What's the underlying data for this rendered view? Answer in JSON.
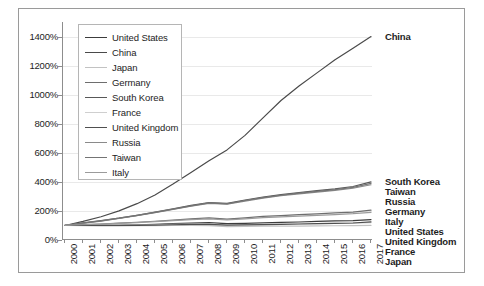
{
  "chart_data": {
    "type": "line",
    "title": "",
    "subtitle": "",
    "xlabel": "",
    "ylabel": "",
    "xlim": [
      2000,
      2017
    ],
    "ylim": [
      0,
      1500
    ],
    "ytick_labels": [
      "1400%",
      "1200%",
      "1000%",
      "800%",
      "600%",
      "400%",
      "200%",
      "0%"
    ],
    "ytick_values": [
      1400,
      1200,
      1000,
      800,
      600,
      400,
      200,
      0
    ],
    "grid": "horizontal",
    "legend_position": "top-left-inside",
    "x": [
      2000,
      2001,
      2002,
      2003,
      2004,
      2005,
      2006,
      2007,
      2008,
      2009,
      2010,
      2011,
      2012,
      2013,
      2014,
      2015,
      2016,
      2017
    ],
    "xtick_labels": [
      "2000",
      "2001",
      "2002",
      "2003",
      "2004",
      "2005",
      "2006",
      "2007",
      "2008",
      "2009",
      "2010",
      "2011",
      "2012",
      "2013",
      "2014",
      "2015",
      "2016",
      "2017"
    ],
    "series": [
      {
        "name": "United States",
        "color": "#3c3c3c",
        "end_label": "United States",
        "values": [
          100,
          102,
          100,
          101,
          104,
          108,
          112,
          116,
          119,
          112,
          114,
          118,
          121,
          124,
          128,
          131,
          134,
          140
        ]
      },
      {
        "name": "China",
        "color": "#4a4a4a",
        "end_label": "China",
        "values": [
          100,
          128,
          160,
          200,
          250,
          310,
          385,
          465,
          545,
          620,
          720,
          840,
          960,
          1060,
          1150,
          1240,
          1320,
          1400
        ]
      },
      {
        "name": "Japan",
        "color": "#c2c2c2",
        "end_label": "Japan",
        "values": [
          100,
          99,
          97,
          97,
          98,
          99,
          100,
          100,
          99,
          92,
          94,
          95,
          95,
          96,
          97,
          98,
          99,
          100
        ]
      },
      {
        "name": "Germany",
        "color": "#6e6e6e",
        "end_label": "Germany",
        "values": [
          100,
          106,
          110,
          116,
          122,
          129,
          137,
          145,
          152,
          144,
          152,
          162,
          168,
          174,
          180,
          186,
          192,
          205
        ]
      },
      {
        "name": "South Korea",
        "color": "#585858",
        "end_label": "South Korea",
        "values": [
          100,
          118,
          133,
          150,
          170,
          192,
          214,
          238,
          258,
          252,
          275,
          296,
          312,
          326,
          340,
          352,
          368,
          400
        ]
      },
      {
        "name": "France",
        "color": "#cfcfcf",
        "end_label": "France",
        "values": [
          100,
          101,
          100,
          101,
          103,
          105,
          107,
          109,
          110,
          104,
          106,
          108,
          109,
          110,
          112,
          114,
          116,
          120
        ]
      },
      {
        "name": "United Kingdom",
        "color": "#4f4f4f",
        "end_label": "United Kingdom",
        "values": [
          100,
          101,
          100,
          100,
          101,
          103,
          105,
          107,
          108,
          102,
          104,
          106,
          108,
          110,
          112,
          114,
          117,
          125
        ]
      },
      {
        "name": "Russia",
        "color": "#8a8a8a",
        "end_label": "Russia",
        "values": [
          100,
          115,
          130,
          148,
          167,
          188,
          210,
          232,
          252,
          246,
          268,
          288,
          305,
          318,
          330,
          342,
          356,
          380
        ]
      },
      {
        "name": "Taiwan",
        "color": "#747474",
        "end_label": "Taiwan",
        "values": [
          100,
          117,
          132,
          150,
          169,
          190,
          212,
          235,
          255,
          249,
          272,
          292,
          308,
          322,
          335,
          347,
          362,
          390
        ]
      },
      {
        "name": "Italy",
        "color": "#9b9b9b",
        "end_label": "Italy",
        "values": [
          100,
          105,
          109,
          114,
          120,
          126,
          133,
          140,
          146,
          138,
          145,
          154,
          159,
          164,
          170,
          175,
          181,
          190
        ]
      }
    ],
    "end_labels": [
      {
        "text": "China",
        "y_value": 1400
      },
      {
        "text": "South Korea",
        "y_value": 400
      },
      {
        "text": "Taiwan",
        "y_value": 390
      },
      {
        "text": "Russia",
        "y_value": 380
      },
      {
        "text": "Germany",
        "y_value": 205
      },
      {
        "text": "Italy",
        "y_value": 190
      },
      {
        "text": "United States",
        "y_value": 140
      },
      {
        "text": "United Kingdom",
        "y_value": 125
      },
      {
        "text": "France",
        "y_value": 120
      },
      {
        "text": "Japan",
        "y_value": 100
      }
    ]
  },
  "legend": {
    "items": [
      {
        "label": "United States"
      },
      {
        "label": "China"
      },
      {
        "label": "Japan"
      },
      {
        "label": "Germany"
      },
      {
        "label": "South Korea"
      },
      {
        "label": "France"
      },
      {
        "label": "United Kingdom"
      },
      {
        "label": "Russia"
      },
      {
        "label": "Taiwan"
      },
      {
        "label": "Italy"
      }
    ]
  }
}
